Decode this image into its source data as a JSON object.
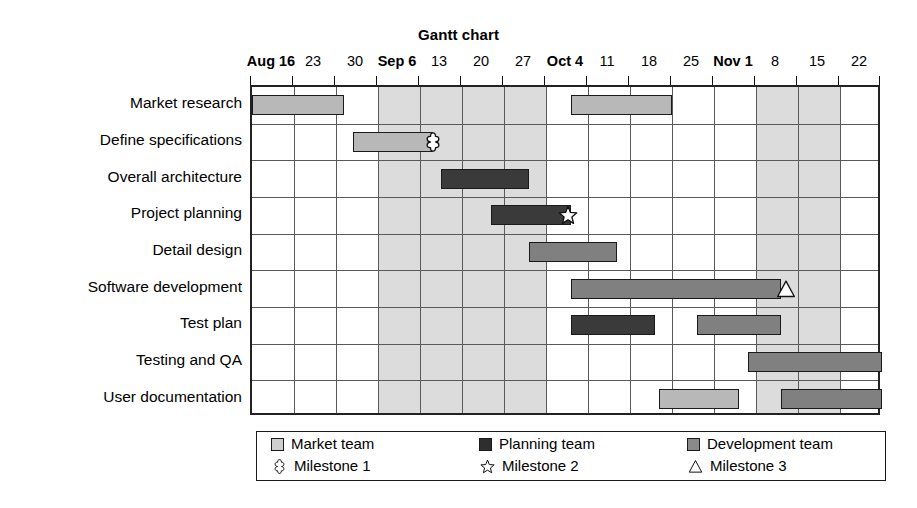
{
  "chart_data": {
    "type": "gantt",
    "title": "Gantt chart",
    "xlabel": "",
    "ylabel": "",
    "grid": true,
    "legend_position": "bottom",
    "axis": {
      "ticks": [
        {
          "label": "Aug 16",
          "bold_prefix": "Aug",
          "value": "Aug 16",
          "index": 0
        },
        {
          "label": "23",
          "value": "Aug 23",
          "index": 1
        },
        {
          "label": "30",
          "value": "Aug 30",
          "index": 2
        },
        {
          "label": "Sep 6",
          "bold_prefix": "Sep",
          "value": "Sep 6",
          "index": 3
        },
        {
          "label": "13",
          "value": "Sep 13",
          "index": 4
        },
        {
          "label": "20",
          "value": "Sep 20",
          "index": 5
        },
        {
          "label": "27",
          "value": "Sep 27",
          "index": 6
        },
        {
          "label": "Oct 4",
          "bold_prefix": "Oct",
          "value": "Oct 4",
          "index": 7
        },
        {
          "label": "11",
          "value": "Oct 11",
          "index": 8
        },
        {
          "label": "18",
          "value": "Oct 18",
          "index": 9
        },
        {
          "label": "25",
          "value": "Oct 25",
          "index": 10
        },
        {
          "label": "Nov 1",
          "bold_prefix": "Nov",
          "value": "Nov 1",
          "index": 11
        },
        {
          "label": "8",
          "value": "Nov 8",
          "index": 12
        },
        {
          "label": "15",
          "value": "Nov 15",
          "index": 13
        },
        {
          "label": "22",
          "value": "Nov 22",
          "index": 14
        }
      ],
      "shaded_column_ranges": [
        [
          3,
          7
        ],
        [
          12,
          14
        ]
      ]
    },
    "tasks": [
      {
        "name": "Market research",
        "row": 0,
        "bars": [
          {
            "team": "market",
            "start": 0.0,
            "end": 2.2
          },
          {
            "team": "market",
            "start": 7.6,
            "end": 10.0
          }
        ]
      },
      {
        "name": "Define specifications",
        "row": 1,
        "bars": [
          {
            "team": "market",
            "start": 2.4,
            "end": 4.3
          }
        ],
        "milestones": [
          {
            "type": "Milestone 1",
            "at": 4.3
          }
        ]
      },
      {
        "name": "Overall architecture",
        "row": 2,
        "bars": [
          {
            "team": "planning",
            "start": 4.5,
            "end": 6.6
          }
        ]
      },
      {
        "name": "Project planning",
        "row": 3,
        "bars": [
          {
            "team": "planning",
            "start": 5.7,
            "end": 7.6
          }
        ],
        "milestones": [
          {
            "type": "Milestone 2",
            "at": 7.5
          }
        ]
      },
      {
        "name": "Detail design",
        "row": 4,
        "bars": [
          {
            "team": "dev",
            "start": 6.6,
            "end": 8.7
          }
        ]
      },
      {
        "name": "Software development",
        "row": 5,
        "bars": [
          {
            "team": "dev",
            "start": 7.6,
            "end": 12.6
          }
        ],
        "milestones": [
          {
            "type": "Milestone 3",
            "at": 12.7
          }
        ]
      },
      {
        "name": "Test plan",
        "row": 6,
        "bars": [
          {
            "team": "planning",
            "start": 7.6,
            "end": 9.6
          },
          {
            "team": "dev",
            "start": 10.6,
            "end": 12.6
          }
        ]
      },
      {
        "name": "Testing and QA",
        "row": 7,
        "bars": [
          {
            "team": "dev",
            "start": 11.8,
            "end": 15.0
          }
        ]
      },
      {
        "name": "User documentation",
        "row": 8,
        "bars": [
          {
            "team": "market",
            "start": 9.7,
            "end": 11.6
          },
          {
            "team": "dev",
            "start": 12.6,
            "end": 15.0
          }
        ]
      }
    ],
    "legend": {
      "teams": [
        {
          "key": "market",
          "label": "Market team",
          "color": "#cfcfcf"
        },
        {
          "key": "planning",
          "label": "Planning team",
          "color": "#2e2e2e"
        },
        {
          "key": "dev",
          "label": "Development team",
          "color": "#8a8a8a"
        }
      ],
      "milestones": [
        {
          "key": "ms1",
          "label": "Milestone 1",
          "icon": "four-point-star-icon"
        },
        {
          "key": "ms2",
          "label": "Milestone 2",
          "icon": "five-point-star-icon"
        },
        {
          "key": "ms3",
          "label": "Milestone 3",
          "icon": "triangle-icon"
        }
      ]
    },
    "colors": {
      "market_team": "#b8b8b8",
      "planning_team": "#3a3a3a",
      "development_team": "#808080",
      "shaded_band": "#dcdcdc",
      "gridline": "#5a5a5a",
      "border": "#1a1a1a",
      "background": "#ffffff"
    }
  }
}
